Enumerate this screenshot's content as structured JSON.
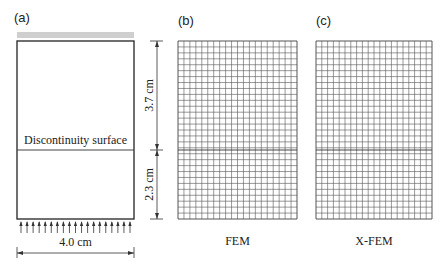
{
  "panels": {
    "a": {
      "label": "(a)",
      "discontinuity_label": "Discontinuity surface",
      "width_label": "4.0 cm",
      "arrow_count": 19
    },
    "b": {
      "label": "(b)",
      "caption": "FEM",
      "columns": 20,
      "rows": 30
    },
    "c": {
      "label": "(c)",
      "caption": "X-FEM",
      "columns": 20,
      "rows": 30
    }
  },
  "dimensions": {
    "upper_height": "3.7 cm",
    "lower_height": "2.3 cm"
  },
  "colors": {
    "line": "#222222",
    "grid": "#555555",
    "top_band": "#cfcfcf"
  }
}
